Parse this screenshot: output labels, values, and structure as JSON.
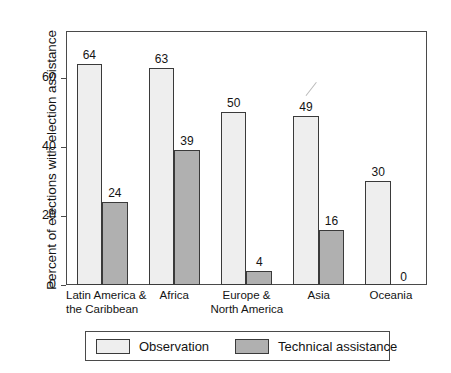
{
  "chart_data": {
    "type": "bar",
    "title": "",
    "xlabel": "",
    "ylabel": "Percent of elections with election assistance",
    "ylim": [
      0,
      73.6
    ],
    "yticks": [
      0,
      20,
      40,
      60
    ],
    "ytick_labels": [
      "0",
      "20",
      "40",
      "60"
    ],
    "grid": false,
    "legend_position": "bottom",
    "categories": [
      "Latin America &\nthe Caribbean",
      "Africa",
      "Europe &\nNorth America",
      "Asia",
      "Oceania"
    ],
    "category_lines": [
      [
        "Latin America &",
        "the Caribbean"
      ],
      [
        "Africa",
        ""
      ],
      [
        "Europe &",
        "North America"
      ],
      [
        "Asia",
        ""
      ],
      [
        "Oceania",
        ""
      ]
    ],
    "series": [
      {
        "name": "Observation",
        "color": "#eeeeee",
        "values": [
          64,
          63,
          50,
          49,
          30
        ],
        "labels": [
          "64",
          "63",
          "50",
          "49",
          "30"
        ]
      },
      {
        "name": "Technical assistance",
        "color": "#b0b0b0",
        "values": [
          24,
          39,
          4,
          16,
          0
        ],
        "labels": [
          "24",
          "39",
          "4",
          "16",
          "0"
        ]
      }
    ]
  },
  "axis": {
    "y_title": "Percent of elections with election assistance",
    "ticks": [
      {
        "value": 60,
        "label": "60"
      },
      {
        "value": 40,
        "label": "40"
      },
      {
        "value": 20,
        "label": "20"
      },
      {
        "value": 0,
        "label": "0"
      }
    ]
  },
  "legend": {
    "items": [
      {
        "label": "Observation",
        "color": "#eeeeee"
      },
      {
        "label": "Technical assistance",
        "color": "#b0b0b0"
      }
    ]
  },
  "colors": {
    "observation": "#eeeeee",
    "technical_assistance": "#b0b0b0",
    "axis_line": "#4a4a4a",
    "bar_outline": "#3a3a3a",
    "text": "#141414",
    "background": "#ffffff"
  }
}
